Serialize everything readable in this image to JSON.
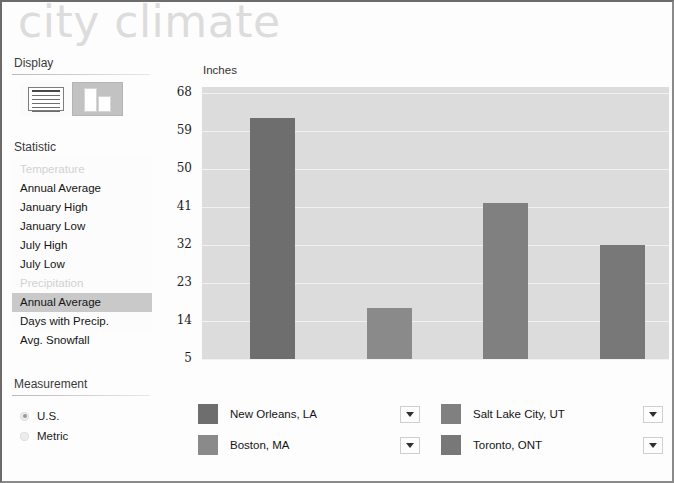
{
  "app": {
    "title": "city climate"
  },
  "sidebar": {
    "display": {
      "label": "Display",
      "options": [
        {
          "name": "table-view",
          "icon": "table-icon",
          "selected": false
        },
        {
          "name": "chart-view",
          "icon": "bar-chart-icon",
          "selected": true
        }
      ]
    },
    "statistic": {
      "label": "Statistic",
      "groups": [
        {
          "header": "Temperature",
          "items": [
            "Annual Average",
            "January High",
            "January Low",
            "July High",
            "July Low"
          ]
        },
        {
          "header": "Precipitation",
          "items": [
            "Annual Average",
            "Days with Precip.",
            "Avg. Snowfall"
          ]
        }
      ],
      "selected": "Annual Average"
    },
    "measurement": {
      "label": "Measurement",
      "options": [
        {
          "label": "U.S.",
          "selected": true
        },
        {
          "label": "Metric",
          "selected": false
        }
      ]
    }
  },
  "chart_data": {
    "type": "bar",
    "title": "",
    "ylabel": "Inches",
    "xlabel": "",
    "categories": [
      "New Orleans, LA",
      "Boston, MA",
      "Salt Lake City, UT",
      "Toronto, ONT"
    ],
    "values": [
      62,
      17,
      42,
      32
    ],
    "yticks": [
      68,
      59,
      50,
      41,
      32,
      23,
      14,
      5
    ],
    "ylim": [
      5,
      68
    ],
    "grid": true,
    "legend_position": "bottom",
    "colors": [
      "#6e6e6e",
      "#8a8a8a",
      "#808080",
      "#787878"
    ],
    "plot_background": "#dcdcdc"
  },
  "legend": {
    "items": [
      {
        "label": "New Orleans, LA",
        "color": "#6e6e6e",
        "dropdown": "chevron-down-icon"
      },
      {
        "label": "Boston, MA",
        "color": "#8a8a8a",
        "dropdown": "chevron-down-icon"
      },
      {
        "label": "Salt Lake City, UT",
        "color": "#808080",
        "dropdown": "chevron-down-icon"
      },
      {
        "label": "Toronto, ONT",
        "color": "#787878",
        "dropdown": "chevron-down-icon"
      }
    ]
  }
}
